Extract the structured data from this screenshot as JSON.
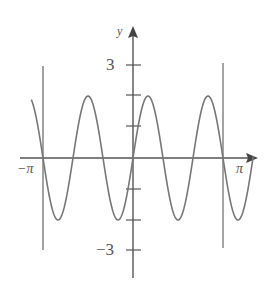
{
  "chart_data": {
    "type": "line",
    "title": "",
    "function": "y = 2 sin(3x)",
    "xlabel": "",
    "ylabel": "y",
    "xlim": [
      -3.55,
      4.2
    ],
    "ylim": [
      -3.9,
      4.3
    ],
    "x_tick_labels": [
      "-π",
      "π"
    ],
    "y_tick_labels": [
      "3",
      "-3"
    ],
    "y_ticks": [
      3,
      2,
      1,
      -1,
      -2,
      -3
    ],
    "vertical_lines": [
      "-π",
      "π"
    ],
    "grid": false,
    "series": [
      {
        "name": "y = 2 sin 3x",
        "amplitude": 2,
        "angular_frequency": 3,
        "x_range": [
          -3.55,
          4.2
        ]
      }
    ],
    "colors": {
      "axis": "#555555",
      "curve": "#777777"
    }
  },
  "labels": {
    "y_axis": "y",
    "y_pos3": "3",
    "y_neg3": "−3",
    "x_neg_pi": "−π",
    "x_pos_pi": "π"
  }
}
